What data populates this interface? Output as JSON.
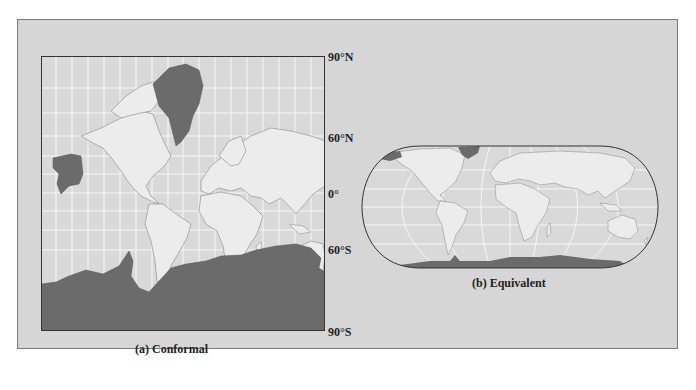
{
  "figure": {
    "panels": [
      {
        "id": "a",
        "caption": "(a) Conformal",
        "projection_type": "Mercator-style (conformal)",
        "latitude_labels": [
          "90°N",
          "60°N",
          "0°",
          "60°S",
          "90°S"
        ]
      },
      {
        "id": "b",
        "caption": "(b) Equivalent",
        "projection_type": "Robinson-style (equal-area)"
      }
    ],
    "colors": {
      "panel_background": "#d6d6d6",
      "ocean": "#d9d9d9",
      "land": "#ececec",
      "highlight_land": "#6b6b6b",
      "graticule": "#f7f7f7",
      "outline": "#333333"
    }
  }
}
